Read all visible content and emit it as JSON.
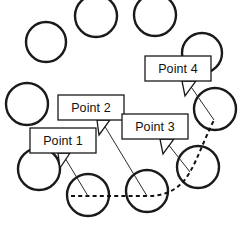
{
  "diagram": {
    "canvas": {
      "width": 244,
      "height": 225,
      "background": "#ffffff"
    },
    "colors": {
      "circle_stroke": "#1a1a1a",
      "circle_fill": "#ffffff",
      "path_stroke": "#111111",
      "callout_stroke": "#1a1a1a",
      "callout_fill": "#ffffff",
      "text": "#111111"
    },
    "circles": [
      {
        "id": "circle-1",
        "cx": 96,
        "cy": 16,
        "r": 21
      },
      {
        "id": "circle-2",
        "cx": 155,
        "cy": 15,
        "r": 21
      },
      {
        "id": "circle-3",
        "cx": 46,
        "cy": 42,
        "r": 20
      },
      {
        "id": "circle-4",
        "cx": 202,
        "cy": 53,
        "r": 20
      },
      {
        "id": "circle-5",
        "cx": 27,
        "cy": 104,
        "r": 21
      },
      {
        "id": "circle-6",
        "cx": 215,
        "cy": 109,
        "r": 21
      },
      {
        "id": "circle-7",
        "cx": 39,
        "cy": 169,
        "r": 21
      },
      {
        "id": "circle-8",
        "cx": 198,
        "cy": 167,
        "r": 21
      },
      {
        "id": "circle-9",
        "cx": 88,
        "cy": 195,
        "r": 21
      },
      {
        "id": "circle-10",
        "cx": 147,
        "cy": 191,
        "r": 21
      }
    ],
    "path": {
      "id": "traversal-path",
      "style": "dashed",
      "d": "M 71 196 L 147 196 C 170 196 182 186 190 172 C 198 158 204 140 214 120"
    },
    "callouts": [
      {
        "id": "point-1",
        "label": "Point 1",
        "box": {
          "x": 30,
          "y": 128,
          "width": 66,
          "height": 25
        },
        "tail": "M 58 153 L 60 168 L 70 153 Z",
        "leader": "M 62 153 L 88 196",
        "target": {
          "x": 88,
          "y": 196
        }
      },
      {
        "id": "point-2",
        "label": "Point 2",
        "box": {
          "x": 58,
          "y": 95,
          "width": 66,
          "height": 25
        },
        "tail": "M 97 120 L 99 135 L 110 120 Z",
        "leader": "M 101 120 L 147 196",
        "target": {
          "x": 147,
          "y": 196
        }
      },
      {
        "id": "point-3",
        "label": "Point 3",
        "box": {
          "x": 122,
          "y": 114,
          "width": 66,
          "height": 25
        },
        "tail": "M 160 139 L 163 154 L 174 139 Z",
        "leader": "M 164 139 L 190 172",
        "target": {
          "x": 190,
          "y": 172
        }
      },
      {
        "id": "point-4",
        "label": "Point 4",
        "box": {
          "x": 145,
          "y": 56,
          "width": 66,
          "height": 25
        },
        "tail": "M 182 81 L 185 96 L 196 81 Z",
        "leader": "M 187 81 L 214 120",
        "target": {
          "x": 214,
          "y": 120
        }
      }
    ]
  }
}
